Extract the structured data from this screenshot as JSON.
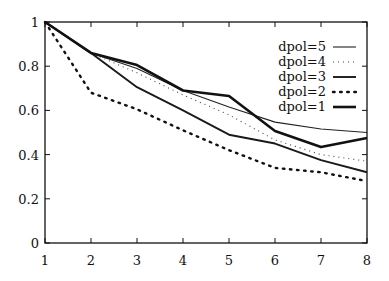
{
  "chart_data": {
    "type": "line",
    "title": "",
    "xlabel": "",
    "ylabel": "",
    "xlim": [
      1,
      8
    ],
    "ylim": [
      0,
      1
    ],
    "grid": false,
    "legend_position": "upper right",
    "x": [
      1,
      2,
      3,
      4,
      5,
      6,
      7,
      8
    ],
    "x_ticks": [
      "1",
      "2",
      "3",
      "4",
      "5",
      "6",
      "7",
      "8"
    ],
    "y_ticks": [
      "0",
      "0.2",
      "0.4",
      "0.6",
      "0.8",
      "1"
    ],
    "series": [
      {
        "name": "dpol=5",
        "style": "thin-solid",
        "values": [
          1.0,
          0.86,
          0.79,
          0.69,
          0.615,
          0.547,
          0.516,
          0.5
        ]
      },
      {
        "name": "dpol=4",
        "style": "fine-dotted",
        "values": [
          1.0,
          0.86,
          0.77,
          0.67,
          0.58,
          0.466,
          0.4,
          0.37
        ]
      },
      {
        "name": "dpol=3",
        "style": "medium-solid",
        "values": [
          1.0,
          0.86,
          0.705,
          0.6,
          0.49,
          0.45,
          0.375,
          0.32
        ]
      },
      {
        "name": "dpol=2",
        "style": "bold-dotted",
        "values": [
          1.0,
          0.68,
          0.605,
          0.51,
          0.42,
          0.34,
          0.32,
          0.28
        ]
      },
      {
        "name": "dpol=1",
        "style": "thick-solid",
        "values": [
          1.0,
          0.86,
          0.805,
          0.69,
          0.665,
          0.507,
          0.434,
          0.475
        ]
      }
    ]
  }
}
